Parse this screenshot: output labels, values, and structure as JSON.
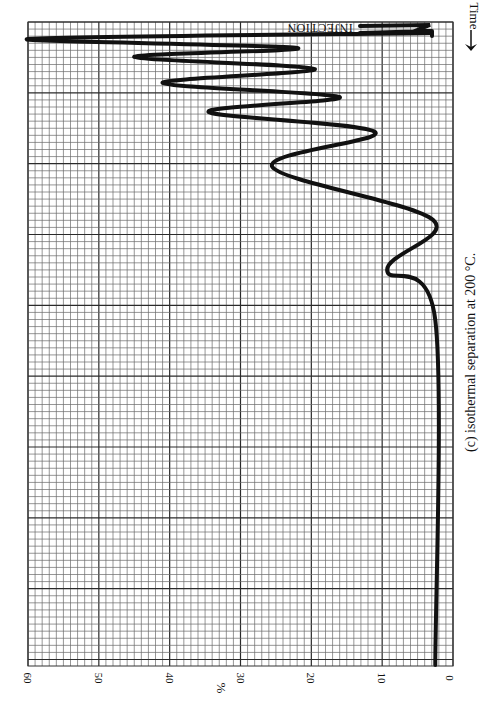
{
  "chart_data": {
    "type": "line",
    "title": "(c) isothermal separation at 200 °C.",
    "orientation": "rotated: time runs top-to-bottom (arrow toward top labeled Time), response axis horizontal with 0 at right and 60 at left",
    "xlabel": "Time",
    "ylabel": "%",
    "ylim": [
      0,
      60
    ],
    "y_ticks": [
      60,
      50,
      40,
      30,
      20,
      10,
      0
    ],
    "grid": true,
    "grid_minor_step": 1,
    "grid_major_step": 10,
    "annotations": [
      "INJECTION",
      "Time"
    ],
    "series": [
      {
        "name": "detector response",
        "points_time_px_vs_percent": [
          {
            "t": 26,
            "v": 3
          },
          {
            "t": 28,
            "v": 9
          },
          {
            "t": 30,
            "v": 2.5
          },
          {
            "t": 33,
            "v": 3
          },
          {
            "t": 39,
            "v": 60
          },
          {
            "t": 48,
            "v": 22
          },
          {
            "t": 57,
            "v": 45
          },
          {
            "t": 69,
            "v": 19.5
          },
          {
            "t": 83,
            "v": 41
          },
          {
            "t": 97,
            "v": 16
          },
          {
            "t": 112,
            "v": 34.5
          },
          {
            "t": 132,
            "v": 11
          },
          {
            "t": 167,
            "v": 25.5
          },
          {
            "t": 220,
            "v": 2.8
          },
          {
            "t": 270,
            "v": 9.3
          },
          {
            "t": 320,
            "v": 2.5
          },
          {
            "t": 665,
            "v": 2.5
          }
        ],
        "peaks": [
          {
            "label": "peak 1",
            "percent": 60,
            "note": "off-scale (≥60%)"
          },
          {
            "label": "peak 2",
            "percent": 45
          },
          {
            "label": "peak 3",
            "percent": 41
          },
          {
            "label": "peak 4",
            "percent": 34.5
          },
          {
            "label": "peak 5",
            "percent": 25.5
          },
          {
            "label": "peak 6",
            "percent": 9.3
          }
        ],
        "baseline_percent": 2.5
      }
    ]
  },
  "labels": {
    "injection": "INJECTION",
    "time": "Time",
    "percent": "%",
    "caption": "(c) isothermal separation at 200 °C.",
    "ticks": [
      "60",
      "50",
      "40",
      "30",
      "20",
      "10",
      "0"
    ]
  },
  "colors": {
    "grid_minor": "#6a6a6a",
    "grid_major": "#2a2a2a",
    "trace": "#111111",
    "background": "#ffffff"
  }
}
